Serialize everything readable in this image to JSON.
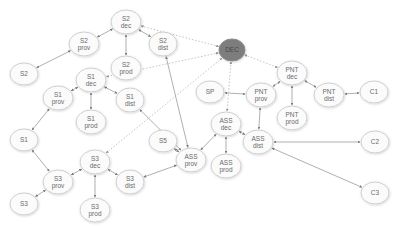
{
  "diagram": {
    "title": "",
    "hub_color": "#7d7d7d",
    "node_fill": "#fbfbfb",
    "node_stroke": "#cfcfcf",
    "edge_color": "#8c8c8c",
    "nodes": [
      {
        "id": "S2dec",
        "lines": [
          "S2",
          "dec"
        ],
        "x": 126,
        "y": 22,
        "rx": 15,
        "ry": 12
      },
      {
        "id": "S2prov",
        "lines": [
          "S2",
          "prov"
        ],
        "x": 84,
        "y": 44,
        "rx": 15,
        "ry": 12
      },
      {
        "id": "S2dist",
        "lines": [
          "S2",
          "dist"
        ],
        "x": 163,
        "y": 44,
        "rx": 14,
        "ry": 12
      },
      {
        "id": "S2prod",
        "lines": [
          "S2",
          "prod"
        ],
        "x": 126,
        "y": 68,
        "rx": 15,
        "ry": 12
      },
      {
        "id": "S2",
        "lines": [
          "S2"
        ],
        "x": 24,
        "y": 74,
        "rx": 14,
        "ry": 11
      },
      {
        "id": "S1dec",
        "lines": [
          "S1",
          "dec"
        ],
        "x": 91,
        "y": 80,
        "rx": 15,
        "ry": 12
      },
      {
        "id": "S1prov",
        "lines": [
          "S1",
          "prov"
        ],
        "x": 58,
        "y": 98,
        "rx": 15,
        "ry": 12
      },
      {
        "id": "S1dist",
        "lines": [
          "S1",
          "dist"
        ],
        "x": 130,
        "y": 100,
        "rx": 14,
        "ry": 12
      },
      {
        "id": "S1prod",
        "lines": [
          "S1",
          "prod"
        ],
        "x": 91,
        "y": 122,
        "rx": 15,
        "ry": 12
      },
      {
        "id": "S1",
        "lines": [
          "S1"
        ],
        "x": 24,
        "y": 140,
        "rx": 14,
        "ry": 11
      },
      {
        "id": "S3dec",
        "lines": [
          "S3",
          "dec"
        ],
        "x": 95,
        "y": 162,
        "rx": 15,
        "ry": 12
      },
      {
        "id": "S3prov",
        "lines": [
          "S3",
          "prov"
        ],
        "x": 58,
        "y": 182,
        "rx": 15,
        "ry": 12
      },
      {
        "id": "S3dist",
        "lines": [
          "S3",
          "dist"
        ],
        "x": 130,
        "y": 182,
        "rx": 14,
        "ry": 12
      },
      {
        "id": "S3prod",
        "lines": [
          "S3",
          "prod"
        ],
        "x": 95,
        "y": 210,
        "rx": 15,
        "ry": 12
      },
      {
        "id": "S3",
        "lines": [
          "S3"
        ],
        "x": 24,
        "y": 204,
        "rx": 14,
        "ry": 11
      },
      {
        "id": "DEC",
        "lines": [
          "DEC"
        ],
        "x": 232,
        "y": 50,
        "rx": 13,
        "ry": 11,
        "hub": true
      },
      {
        "id": "PNTdec",
        "lines": [
          "PNT",
          "dec"
        ],
        "x": 292,
        "y": 73,
        "rx": 15,
        "ry": 12
      },
      {
        "id": "PNTprov",
        "lines": [
          "PNT",
          "prov"
        ],
        "x": 261,
        "y": 95,
        "rx": 15,
        "ry": 12
      },
      {
        "id": "PNTdist",
        "lines": [
          "PNT",
          "dist"
        ],
        "x": 329,
        "y": 95,
        "rx": 15,
        "ry": 12
      },
      {
        "id": "PNTprod",
        "lines": [
          "PNT",
          "prod"
        ],
        "x": 292,
        "y": 118,
        "rx": 15,
        "ry": 12
      },
      {
        "id": "SP",
        "lines": [
          "SP"
        ],
        "x": 210,
        "y": 92,
        "rx": 14,
        "ry": 11
      },
      {
        "id": "C1",
        "lines": [
          "C1"
        ],
        "x": 374,
        "y": 92,
        "rx": 14,
        "ry": 11
      },
      {
        "id": "S5",
        "lines": [
          "S5"
        ],
        "x": 163,
        "y": 141,
        "rx": 14,
        "ry": 11
      },
      {
        "id": "ASSprov",
        "lines": [
          "ASS",
          "prov"
        ],
        "x": 191,
        "y": 160,
        "rx": 15,
        "ry": 12
      },
      {
        "id": "ASSdec",
        "lines": [
          "ASS",
          "dec"
        ],
        "x": 226,
        "y": 124,
        "rx": 15,
        "ry": 12
      },
      {
        "id": "ASSdist",
        "lines": [
          "ASS",
          "dist"
        ],
        "x": 258,
        "y": 142,
        "rx": 15,
        "ry": 12
      },
      {
        "id": "ASSprod",
        "lines": [
          "ASS",
          "prod"
        ],
        "x": 226,
        "y": 166,
        "rx": 15,
        "ry": 12
      },
      {
        "id": "C2",
        "lines": [
          "C2"
        ],
        "x": 375,
        "y": 142,
        "rx": 14,
        "ry": 11
      },
      {
        "id": "C3",
        "lines": [
          "C3"
        ],
        "x": 375,
        "y": 193,
        "rx": 14,
        "ry": 11
      }
    ],
    "edges": [
      {
        "from": "S2dec",
        "to": "S2prov",
        "style": "solid"
      },
      {
        "from": "S2dec",
        "to": "S2dist",
        "style": "solid"
      },
      {
        "from": "S2dec",
        "to": "S2prod",
        "style": "solid"
      },
      {
        "from": "S2prov",
        "to": "S2",
        "style": "solid"
      },
      {
        "from": "S2dist",
        "to": "ASSprov",
        "style": "solid"
      },
      {
        "from": "S1dec",
        "to": "S1prov",
        "style": "solid"
      },
      {
        "from": "S1dec",
        "to": "S1dist",
        "style": "solid"
      },
      {
        "from": "S1dec",
        "to": "S1prod",
        "style": "solid"
      },
      {
        "from": "S1prov",
        "to": "S1",
        "style": "solid"
      },
      {
        "from": "S1dist",
        "to": "ASSprov",
        "style": "solid"
      },
      {
        "from": "S1",
        "to": "S3prov",
        "style": "solid"
      },
      {
        "from": "S3dec",
        "to": "S3prov",
        "style": "solid"
      },
      {
        "from": "S3dec",
        "to": "S3dist",
        "style": "solid"
      },
      {
        "from": "S3dec",
        "to": "S3prod",
        "style": "solid"
      },
      {
        "from": "S3prov",
        "to": "S3",
        "style": "solid"
      },
      {
        "from": "S3dist",
        "to": "ASSprov",
        "style": "solid"
      },
      {
        "from": "S5",
        "to": "ASSprov",
        "style": "solid"
      },
      {
        "from": "ASSprov",
        "to": "ASSdec",
        "style": "solid"
      },
      {
        "from": "ASSdec",
        "to": "ASSdist",
        "style": "solid"
      },
      {
        "from": "ASSdec",
        "to": "ASSprod",
        "style": "solid"
      },
      {
        "from": "ASSdist",
        "to": "C2",
        "style": "solid"
      },
      {
        "from": "ASSdist",
        "to": "C3",
        "style": "solid"
      },
      {
        "from": "PNTprov",
        "to": "ASSdist",
        "style": "solid"
      },
      {
        "from": "SP",
        "to": "PNTprov",
        "style": "solid"
      },
      {
        "from": "PNTdec",
        "to": "PNTprov",
        "style": "solid"
      },
      {
        "from": "PNTdec",
        "to": "PNTdist",
        "style": "solid"
      },
      {
        "from": "PNTdec",
        "to": "PNTprod",
        "style": "solid"
      },
      {
        "from": "PNTdist",
        "to": "C1",
        "style": "solid"
      },
      {
        "from": "DEC",
        "to": "S2dec",
        "style": "dashed"
      },
      {
        "from": "DEC",
        "to": "S1dec",
        "style": "dashed",
        "via": "S2prod"
      },
      {
        "from": "DEC",
        "to": "S3dec",
        "style": "dashed"
      },
      {
        "from": "DEC",
        "to": "ASSdec",
        "style": "dashed"
      },
      {
        "from": "DEC",
        "to": "PNTdec",
        "style": "dashed"
      }
    ]
  }
}
